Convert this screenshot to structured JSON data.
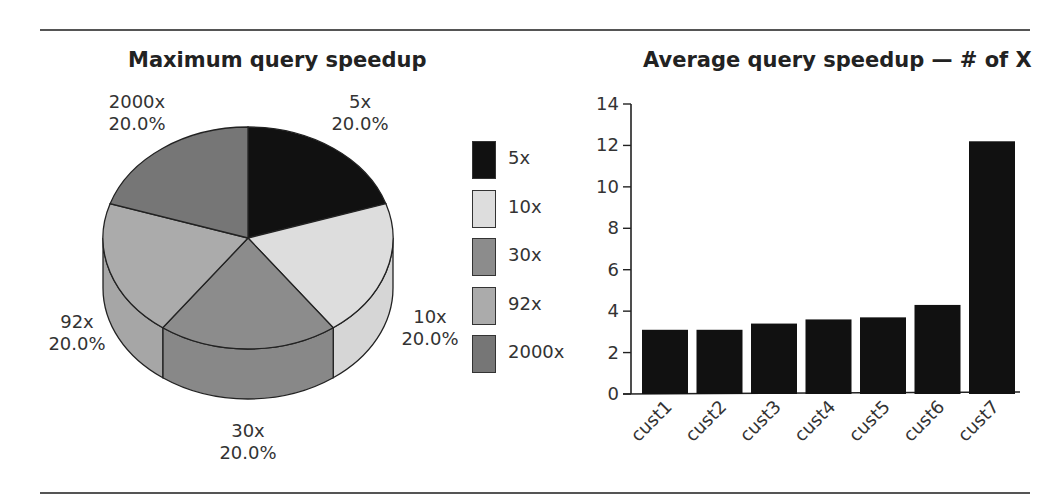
{
  "chart_data": [
    {
      "type": "pie",
      "style": "3d",
      "title": "Maximum query speedup",
      "categories": [
        "5x",
        "10x",
        "30x",
        "92x",
        "2000x"
      ],
      "values": [
        20.0,
        20.0,
        20.0,
        20.0,
        20.0
      ],
      "value_labels": [
        "20.0%",
        "20.0%",
        "20.0%",
        "20.0%",
        "20.0%"
      ],
      "colors": [
        "#111111",
        "#dddddd",
        "#8c8c8c",
        "#ababab",
        "#767676"
      ],
      "legend": [
        "5x",
        "10x",
        "30x",
        "92x",
        "2000x"
      ],
      "legend_position": "right"
    },
    {
      "type": "bar",
      "title": "Average query speedup — # of X",
      "categories": [
        "cust1",
        "cust2",
        "cust3",
        "cust4",
        "cust5",
        "cust6",
        "cust7"
      ],
      "values": [
        3.1,
        3.1,
        3.4,
        3.6,
        3.7,
        4.3,
        12.2
      ],
      "xlabel": "",
      "ylabel": "",
      "ylim": [
        0,
        14
      ],
      "yticks": [
        0,
        2,
        4,
        6,
        8,
        10,
        12,
        14
      ],
      "grid": false,
      "bar_color": "#111111"
    }
  ],
  "pie": {
    "title": "Maximum query speedup",
    "slice_labels": [
      {
        "name": "2000x",
        "pct": "20.0%"
      },
      {
        "name": "5x",
        "pct": "20.0%"
      },
      {
        "name": "92x",
        "pct": "20.0%"
      },
      {
        "name": "10x",
        "pct": "20.0%"
      },
      {
        "name": "30x",
        "pct": "20.0%"
      }
    ],
    "legend": [
      {
        "label": "5x",
        "color": "#111111"
      },
      {
        "label": "10x",
        "color": "#dddddd"
      },
      {
        "label": "30x",
        "color": "#8c8c8c"
      },
      {
        "label": "92x",
        "color": "#ababab"
      },
      {
        "label": "2000x",
        "color": "#767676"
      }
    ]
  },
  "bar": {
    "title": "Average query speedup — # of X"
  }
}
